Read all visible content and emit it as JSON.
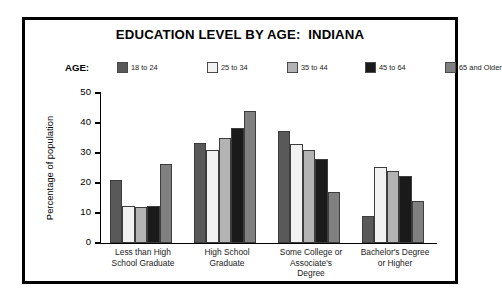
{
  "figure": {
    "title": "EDUCATION LEVEL BY AGE:  INDIANA"
  },
  "legend": {
    "title": "AGE:",
    "entries": [
      {
        "label": "18 to 24",
        "color": "#595959"
      },
      {
        "label": "25 to 34",
        "color": "#f2f2f2"
      },
      {
        "label": "35 to 44",
        "color": "#b3b3b3"
      },
      {
        "label": "45 to 64",
        "color": "#1a1a1a"
      },
      {
        "label": "65 and Older",
        "color": "#808080"
      }
    ]
  },
  "axes": {
    "y_title": "Percentage of population",
    "y_ticks": [
      "0",
      "10",
      "20",
      "30",
      "40",
      "50"
    ]
  },
  "chart_data": {
    "type": "bar",
    "title": "EDUCATION LEVEL BY AGE:  INDIANA",
    "xlabel": "",
    "ylabel": "Percentage of population",
    "ylim": [
      0,
      50
    ],
    "yticks": [
      0,
      10,
      20,
      30,
      40,
      50
    ],
    "grid": false,
    "legend_position": "top",
    "legend_title": "AGE:",
    "categories": [
      "Less than High\nSchool Graduate",
      "High School\nGraduate",
      "Some College or\nAssociate's\nDegree",
      "Bachelor's Degree\nor Higher"
    ],
    "series": [
      {
        "name": "18 to 24",
        "color": "#595959",
        "values": [
          21.0,
          33.5,
          37.5,
          9.0
        ]
      },
      {
        "name": "25 to 34",
        "color": "#f2f2f2",
        "values": [
          12.5,
          31.0,
          33.0,
          25.5
        ]
      },
      {
        "name": "35 to 44",
        "color": "#b3b3b3",
        "values": [
          12.0,
          35.0,
          31.0,
          24.0
        ]
      },
      {
        "name": "45 to 64",
        "color": "#1a1a1a",
        "values": [
          12.5,
          38.5,
          28.0,
          22.5
        ]
      },
      {
        "name": "65 and Older",
        "color": "#808080",
        "values": [
          26.5,
          44.0,
          17.0,
          14.0
        ]
      }
    ]
  }
}
